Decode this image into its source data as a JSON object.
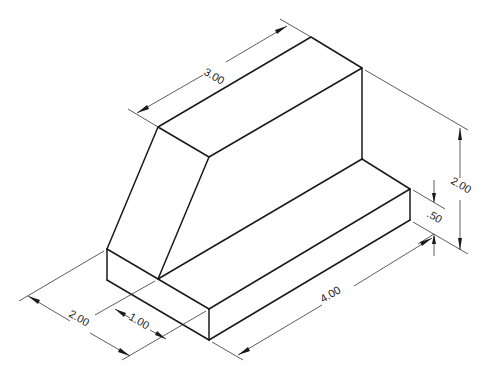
{
  "drawing": {
    "type": "isometric-technical-drawing",
    "line_color": "#1a1a1a",
    "background": "#ffffff",
    "dimensions": {
      "top_length": "3.00",
      "overall_height": "2.00",
      "base_height": ".50",
      "base_length": "4.00",
      "overall_depth": "2.00",
      "upper_block_offset": "1.00"
    }
  }
}
